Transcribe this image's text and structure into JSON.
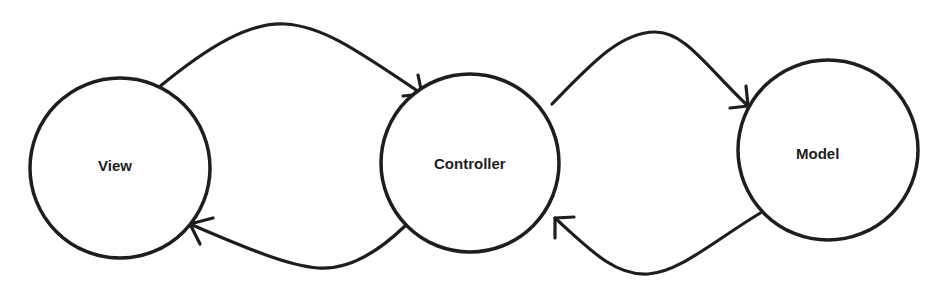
{
  "diagram": {
    "colors": {
      "stroke": "#1e1e1e",
      "background": "#ffffff",
      "text": "#1e1e1e"
    },
    "nodes": [
      {
        "id": "view",
        "label": "View",
        "cx": 120,
        "cy": 168,
        "r": 90,
        "label_x": 98,
        "label_y": 171
      },
      {
        "id": "controller",
        "label": "Controller",
        "cx": 470,
        "cy": 163,
        "r": 89,
        "label_x": 434,
        "label_y": 169
      },
      {
        "id": "model",
        "label": "Model",
        "cx": 828,
        "cy": 150,
        "r": 90,
        "label_x": 796,
        "label_y": 159
      }
    ],
    "edges": [
      {
        "id": "view-to-controller",
        "from": "view",
        "to": "controller",
        "path": "M158 88 C 210 45, 250 22, 285 24 C 320 26, 350 45, 422 94",
        "arrow": "M422 94 L 403 96 M422 94 L 418 75"
      },
      {
        "id": "controller-to-view",
        "from": "controller",
        "to": "view",
        "path": "M405 226 C 375 255, 345 270, 318 268 C 290 266, 250 250, 190 224",
        "arrow": "M190 224 L 213 218 M190 224 L 200 244"
      },
      {
        "id": "controller-to-model",
        "from": "controller",
        "to": "model",
        "path": "M552 104 C 590 65, 620 32, 655 32 C 685 32, 705 65, 748 106",
        "arrow": "M748 106 L 730 108 M748 106 L 746 86"
      },
      {
        "id": "model-to-controller",
        "from": "model",
        "to": "controller",
        "path": "M762 212 C 715 240, 680 272, 648 274 C 615 276, 590 250, 555 218",
        "arrow": "M555 218 L 574 217 M555 218 L 555 238"
      }
    ]
  }
}
